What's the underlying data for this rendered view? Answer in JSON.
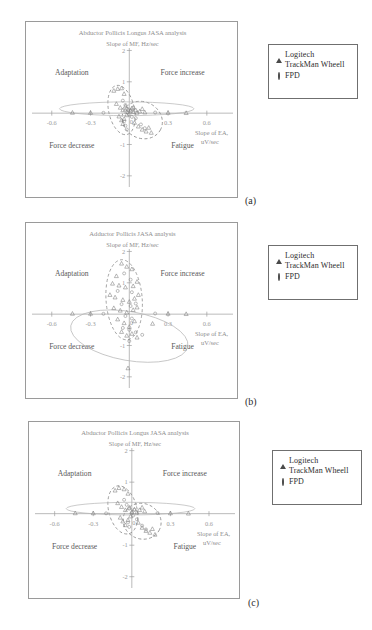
{
  "figure": {
    "panels": [
      {
        "caption": "(a)",
        "title": "Abductor Pollicis Longus JASA analysis",
        "ylabel": "Slope of MF, Hz/sec",
        "xlabel_line1": "Slope of EA,",
        "xlabel_line2": "uV/sec",
        "quadrants": {
          "top_left": "Adaptation",
          "top_right": "Force increase",
          "bottom_left": "Force decrease",
          "bottom_right": "Fatigue"
        },
        "xticks": [
          "-0.6",
          "-0.3",
          "0",
          "0.3",
          "0.6"
        ],
        "yticks": [
          "2",
          "1",
          "-1",
          "-2"
        ]
      },
      {
        "caption": "(b)",
        "title": "Adductor Pollicis JASA analysis",
        "ylabel": "Slope of MF, Hz/sec",
        "xlabel_line1": "Slope of EA,",
        "xlabel_line2": "uV/sec",
        "quadrants": {
          "top_left": "Adaptation",
          "top_right": "Force increase",
          "bottom_left": "Force decrease",
          "bottom_right": "Fatigue"
        },
        "xticks": [
          "-0.6",
          "-0.3",
          "0",
          "0.3",
          "0.6"
        ],
        "yticks": [
          "2",
          "1",
          "-1",
          "-2"
        ]
      },
      {
        "caption": "(c)",
        "title": "Abductor Pollicis Longus JASA analysis",
        "ylabel": "Slope of MF, Hz/sec",
        "xlabel_line1": "Slope of EA,",
        "xlabel_line2": "uV/sec",
        "quadrants": {
          "top_left": "Adaptation",
          "top_right": "Force increase",
          "bottom_left": "Force decrease",
          "bottom_right": "Fatigue"
        },
        "xticks": [
          "-0.6",
          "-0.3",
          "0",
          "0.3",
          "0.6"
        ],
        "yticks": [
          "2",
          "1",
          "-1",
          "-2"
        ]
      }
    ],
    "legend": {
      "items": [
        {
          "marker": "triangle-marker",
          "label_line1": "Logitech",
          "label_line2": "TrackMan Wheell"
        },
        {
          "marker": "circle-marker",
          "label_line1": "FPD",
          "label_line2": ""
        }
      ]
    }
  },
  "chart_data": {
    "type": "scatter",
    "xlabel": "Slope of EA, uV/sec",
    "ylabel": "Slope of MF, Hz/sec",
    "xlim": [
      -0.75,
      0.75
    ],
    "ylim": [
      -2.4,
      2.4
    ],
    "xticks": [
      -0.6,
      -0.3,
      0,
      0.3,
      0.6
    ],
    "yticks": [
      2,
      1,
      -1,
      -2
    ],
    "grid": false,
    "legend_position": "outside-right",
    "quadrant_annotations": [
      {
        "text": "Adaptation",
        "quadrant": "top-left"
      },
      {
        "text": "Force increase",
        "quadrant": "top-right"
      },
      {
        "text": "Force decrease",
        "quadrant": "bottom-left"
      },
      {
        "text": "Fatigue",
        "quadrant": "bottom-right"
      }
    ],
    "panels": [
      {
        "caption": "(a)",
        "title": "Abductor Pollicis Longus JASA analysis",
        "series": [
          {
            "name": "Logitech TrackMan Wheell",
            "marker": "triangle",
            "points": [
              [
                -0.12,
                0.72
              ],
              [
                -0.09,
                0.78
              ],
              [
                -0.06,
                0.8
              ],
              [
                -0.04,
                0.62
              ],
              [
                -0.1,
                0.3
              ],
              [
                -0.07,
                0.18
              ],
              [
                -0.05,
                0.1
              ],
              [
                -0.03,
                0.22
              ],
              [
                -0.02,
                0.05
              ],
              [
                -0.01,
                0.12
              ],
              [
                0.01,
                0.08
              ],
              [
                0.02,
                0.16
              ],
              [
                0.03,
                0.04
              ],
              [
                0.05,
                0.1
              ],
              [
                0.06,
                0.02
              ],
              [
                0.08,
                0.06
              ],
              [
                0.1,
                0.14
              ],
              [
                0.12,
                0.03
              ],
              [
                -0.08,
                -0.1
              ],
              [
                -0.06,
                -0.22
              ],
              [
                -0.05,
                -0.34
              ],
              [
                -0.04,
                -0.18
              ],
              [
                -0.02,
                -0.06
              ],
              [
                0.04,
                -0.3
              ],
              [
                0.07,
                -0.42
              ],
              [
                0.1,
                -0.52
              ],
              [
                0.13,
                -0.58
              ],
              [
                0.15,
                -0.46
              ],
              [
                0.17,
                -0.62
              ],
              [
                -0.3,
                0.02
              ],
              [
                -0.44,
                0.02
              ],
              [
                0.3,
                0.02
              ],
              [
                0.44,
                0.01
              ]
            ]
          },
          {
            "name": "FPD",
            "marker": "circle",
            "points": [
              [
                -0.05,
                0.4
              ],
              [
                -0.03,
                0.26
              ],
              [
                -0.02,
                0.14
              ],
              [
                -0.01,
                0.02
              ],
              [
                0.0,
                -0.04
              ],
              [
                0.01,
                0.1
              ],
              [
                0.02,
                -0.12
              ],
              [
                0.03,
                0.18
              ],
              [
                -0.04,
                -0.26
              ],
              [
                -0.03,
                -0.4
              ],
              [
                -0.02,
                -0.52
              ],
              [
                0.05,
                -0.16
              ],
              [
                0.09,
                -0.36
              ],
              [
                0.12,
                -0.48
              ],
              [
                -0.2,
                0.01
              ],
              [
                0.2,
                0.02
              ]
            ]
          }
        ],
        "cluster_ellipses": [
          {
            "cx": -0.06,
            "cy": 0.1,
            "rx": 0.1,
            "ry": 0.8,
            "rotation": -12,
            "style": "dashed"
          },
          {
            "cx": 0.1,
            "cy": -0.22,
            "rx": 0.16,
            "ry": 0.58,
            "rotation": 28,
            "style": "dashed"
          },
          {
            "cx": -0.02,
            "cy": 0.14,
            "rx": 0.52,
            "ry": 0.22,
            "rotation": 0,
            "style": "solid"
          }
        ]
      },
      {
        "caption": "(b)",
        "title": "Adductor Pollicis JASA analysis",
        "series": [
          {
            "name": "Logitech TrackMan Wheell",
            "marker": "triangle",
            "points": [
              [
                -0.06,
                1.62
              ],
              [
                -0.02,
                1.52
              ],
              [
                0.02,
                1.44
              ],
              [
                -0.1,
                1.22
              ],
              [
                -0.13,
                0.98
              ],
              [
                -0.08,
                0.92
              ],
              [
                -0.03,
                0.86
              ],
              [
                0.03,
                0.9
              ],
              [
                0.06,
                1.04
              ],
              [
                -0.15,
                0.62
              ],
              [
                -0.11,
                0.54
              ],
              [
                -0.05,
                0.46
              ],
              [
                0.0,
                0.4
              ],
              [
                0.04,
                0.5
              ],
              [
                0.07,
                0.62
              ],
              [
                -0.12,
                0.2
              ],
              [
                -0.07,
                0.12
              ],
              [
                -0.02,
                0.06
              ],
              [
                0.03,
                0.14
              ],
              [
                0.06,
                0.22
              ],
              [
                -0.09,
                -0.16
              ],
              [
                -0.04,
                -0.28
              ],
              [
                0.0,
                -0.4
              ],
              [
                0.04,
                -0.22
              ],
              [
                -0.06,
                -0.56
              ],
              [
                -0.02,
                -0.68
              ],
              [
                0.02,
                -0.62
              ],
              [
                0.06,
                -0.74
              ],
              [
                0.18,
                -0.3
              ],
              [
                0.3,
                0.02
              ],
              [
                0.44,
                0.01
              ],
              [
                -0.3,
                0.02
              ],
              [
                -0.44,
                0.02
              ],
              [
                -0.01,
                -1.72
              ]
            ]
          },
          {
            "name": "FPD",
            "marker": "circle",
            "points": [
              [
                -0.04,
                1.3
              ],
              [
                0.01,
                1.1
              ],
              [
                -0.09,
                0.74
              ],
              [
                0.02,
                0.7
              ],
              [
                -0.06,
                0.32
              ],
              [
                0.01,
                0.26
              ],
              [
                0.05,
                0.34
              ],
              [
                -0.03,
                -0.06
              ],
              [
                0.02,
                -0.14
              ],
              [
                -0.05,
                -0.44
              ],
              [
                0.0,
                -0.5
              ],
              [
                0.05,
                -0.58
              ],
              [
                0.1,
                -0.66
              ],
              [
                0.2,
                0.02
              ],
              [
                -0.2,
                0.01
              ],
              [
                0.0,
                -0.86
              ]
            ]
          }
        ],
        "cluster_ellipses": [
          {
            "cx": -0.04,
            "cy": 0.46,
            "rx": 0.14,
            "ry": 1.28,
            "rotation": -4,
            "style": "dashed"
          },
          {
            "cx": 0.0,
            "cy": -0.7,
            "rx": 0.46,
            "ry": 0.78,
            "rotation": 10,
            "style": "solid"
          }
        ]
      },
      {
        "caption": "(c)",
        "title": "Abductor Pollicis Longus JASA analysis",
        "series": [
          {
            "name": "Logitech TrackMan Wheell",
            "marker": "triangle",
            "points": [
              [
                -0.13,
                0.74
              ],
              [
                -0.1,
                0.82
              ],
              [
                -0.06,
                0.78
              ],
              [
                -0.03,
                0.64
              ],
              [
                -0.11,
                0.34
              ],
              [
                -0.08,
                0.22
              ],
              [
                -0.05,
                0.12
              ],
              [
                -0.02,
                0.2
              ],
              [
                0.0,
                0.06
              ],
              [
                0.02,
                0.14
              ],
              [
                0.04,
                0.04
              ],
              [
                0.06,
                0.12
              ],
              [
                0.08,
                0.2
              ],
              [
                0.1,
                0.08
              ],
              [
                -0.09,
                -0.12
              ],
              [
                -0.07,
                -0.24
              ],
              [
                -0.05,
                -0.36
              ],
              [
                -0.03,
                -0.2
              ],
              [
                -0.01,
                -0.08
              ],
              [
                0.05,
                -0.28
              ],
              [
                0.08,
                -0.44
              ],
              [
                0.11,
                -0.54
              ],
              [
                0.14,
                -0.6
              ],
              [
                0.16,
                -0.48
              ],
              [
                -0.3,
                0.02
              ],
              [
                -0.44,
                0.02
              ],
              [
                0.3,
                0.02
              ],
              [
                0.44,
                0.01
              ],
              [
                0.18,
                -0.66
              ]
            ]
          },
          {
            "name": "FPD",
            "marker": "circle",
            "points": [
              [
                -0.06,
                0.44
              ],
              [
                -0.04,
                0.28
              ],
              [
                -0.02,
                0.16
              ],
              [
                0.0,
                0.02
              ],
              [
                0.01,
                -0.06
              ],
              [
                0.02,
                0.12
              ],
              [
                -0.03,
                -0.28
              ],
              [
                -0.02,
                -0.42
              ],
              [
                0.04,
                -0.18
              ],
              [
                0.08,
                -0.38
              ],
              [
                0.11,
                -0.5
              ],
              [
                -0.2,
                0.01
              ],
              [
                0.2,
                0.02
              ]
            ]
          }
        ],
        "cluster_ellipses": [
          {
            "cx": -0.07,
            "cy": 0.12,
            "rx": 0.11,
            "ry": 0.78,
            "rotation": -14,
            "style": "dashed"
          },
          {
            "cx": 0.08,
            "cy": -0.24,
            "rx": 0.15,
            "ry": 0.56,
            "rotation": 26,
            "style": "dashed"
          },
          {
            "cx": -0.01,
            "cy": 0.16,
            "rx": 0.5,
            "ry": 0.2,
            "rotation": 0,
            "style": "solid"
          }
        ]
      }
    ]
  }
}
